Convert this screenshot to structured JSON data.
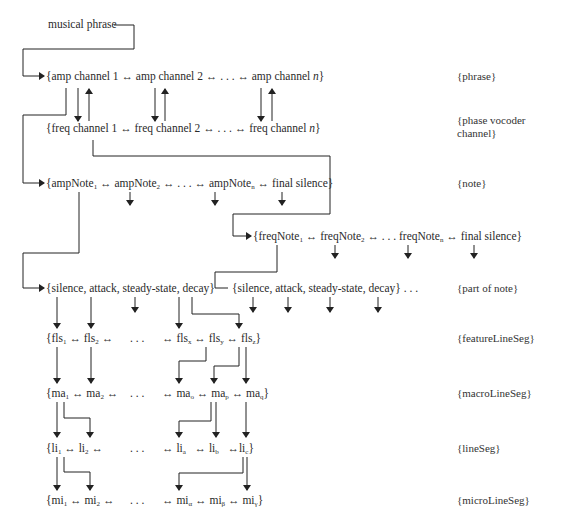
{
  "diagram": {
    "root": "musical phrase",
    "rows": {
      "amp_channel": {
        "text": "{amp channel 1 ↔ amp channel 2 ↔ . . . ↔ amp channel n}",
        "level": "{phrase}"
      },
      "freq_channel": {
        "text": "{freq channel 1 ↔ freq channel 2 ↔ . . . ↔ freq channel n}",
        "level_line1": "{phase vocoder",
        "level_line2": "channel}"
      },
      "amp_note": {
        "text": "{ampNote1 ↔ ampNote2 ↔ . . . ↔ ampNoten ↔ final silence}",
        "level": "{note}"
      },
      "freq_note": {
        "text": "{freqNote1 ↔ freqNote2 ↔ . . . freqNoten ↔ final silence}"
      },
      "part_of_note_amp": {
        "text": "{silence, attack, steady-state, decay}"
      },
      "part_of_note_freq": {
        "text": "{silence, attack, steady-state, decay} . . .",
        "level": "{part of note}"
      },
      "feature_line_seg": {
        "text": "{fls1 ↔ fls2 ↔   . . .   ↔ flsx ↔ flsy ↔ flsz}",
        "level": "{featureLineSeg}"
      },
      "macro_line_seg": {
        "text": "{ma1 ↔ ma2 ↔   . . .   ↔ mao ↔ map ↔ maq}",
        "level": "{macroLineSeg}"
      },
      "line_seg": {
        "text": "{li1 ↔ li2 ↔   . . .   ↔ lia ↔ lib ↔ lic}",
        "level": "{lineSeg}"
      },
      "micro_line_seg": {
        "text": "{mi1 ↔ mi2 ↔   . . .   ↔ miα ↔ miβ ↔ miγ}",
        "level": "{microLineSeg}"
      }
    },
    "parts": {
      "amp_channel": [
        "{amp channel 1 ↔ amp channel 2 ↔ . . . ↔ amp channel ",
        "n",
        "}"
      ],
      "freq_channel": [
        "{freq channel 1 ↔ freq channel 2 ↔ . . . ↔ freq channel ",
        "n",
        "}"
      ],
      "amp_note": [
        "{ampNote",
        "1",
        " ↔ ampNote",
        "2",
        " ↔ . . . ↔ ampNote",
        "n",
        " ↔ final silence}"
      ],
      "freq_note": [
        "{freqNote",
        "1",
        " ↔ freqNote",
        "2",
        " ↔ . . . freqNote",
        "n",
        " ↔ final silence}"
      ],
      "fls_a": [
        "{fls",
        "1",
        " ↔ fls",
        "2",
        " ↔"
      ],
      "fls_b": [
        "↔ fls",
        "x",
        " ↔ fls",
        "y",
        " ↔ fls",
        "z",
        "}"
      ],
      "ma_a": [
        "{ma",
        "1",
        " ↔ ma",
        "2",
        " ↔"
      ],
      "ma_b": [
        "↔ ma",
        "o",
        " ↔ ma",
        "p",
        " ↔ ma",
        "q",
        "}"
      ],
      "li_a": [
        "{li",
        "1",
        " ↔ li",
        "2",
        " ↔"
      ],
      "li_b": [
        "↔ li",
        "a",
        "   ↔ li",
        "b",
        "   ↔li",
        "c",
        "}"
      ],
      "mi_a": [
        "{mi",
        "1",
        " ↔ mi",
        "2",
        " ↔"
      ],
      "mi_b": [
        "↔ mi",
        "α",
        " ↔ mi",
        "β",
        " ↔ mi",
        "γ",
        "}"
      ],
      "ellipsis": ". . ."
    }
  }
}
